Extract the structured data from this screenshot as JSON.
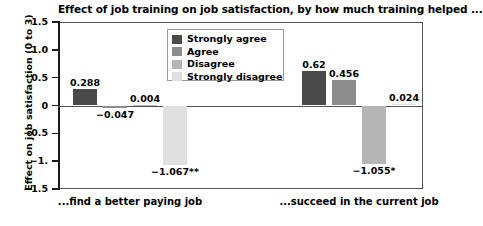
{
  "chart_data": {
    "type": "bar",
    "title": "Effect of job training on job satisfaction, by how much training helped ...",
    "xlabel": "",
    "ylabel": "Effect on job satisfaction (0 to 3)",
    "ylim": [
      -1.5,
      1.5
    ],
    "yticks": [
      "1.5",
      "1.0",
      "0.5",
      "0",
      "−0.5",
      "−1.",
      "−1.5"
    ],
    "ytick_values": [
      1.5,
      1.0,
      0.5,
      0,
      -0.5,
      -1.0,
      -1.5
    ],
    "grid": false,
    "legend_position": "upper center",
    "categories": [
      "...find a better paying job",
      "...succeed in the current job"
    ],
    "series": [
      {
        "name": "Strongly agree",
        "color": "#4a4a4a",
        "values": [
          0.288,
          0.62
        ],
        "labels": [
          "0.288",
          "0.62"
        ]
      },
      {
        "name": "Agree",
        "color": "#8c8c8c",
        "values": [
          -0.047,
          0.456
        ],
        "labels": [
          "−0.047",
          "0.456"
        ]
      },
      {
        "name": "Disagree",
        "color": "#b5b5b5",
        "values": [
          0.004,
          -1.055
        ],
        "labels": [
          "0.004",
          "−1.055*"
        ]
      },
      {
        "name": "Strongly disagree",
        "color": "#e0e0e0",
        "values": [
          -1.067,
          0.024
        ],
        "labels": [
          "−1.067**",
          "0.024"
        ]
      }
    ]
  },
  "legend": {
    "items": [
      {
        "label": "Strongly agree"
      },
      {
        "label": "Agree"
      },
      {
        "label": "Disagree"
      },
      {
        "label": "Strongly disagree"
      }
    ]
  },
  "colors": {
    "strongly_agree": "#4a4a4a",
    "agree": "#8c8c8c",
    "disagree": "#b5b5b5",
    "strongly_disagree": "#e0e0e0",
    "axis": "#1a1a1a",
    "frame": "#555555",
    "background": "#ffffff"
  }
}
